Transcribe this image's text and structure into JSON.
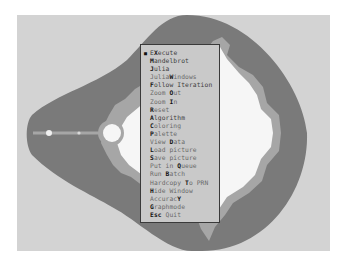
{
  "app": {
    "name": "Mandelbrot fractal explorer",
    "colors": {
      "background": "#d3d3d3",
      "outer_band": "#7a7a7a",
      "fringe": "#a8a8a8",
      "set_interior": "#f7f7f7",
      "menu_bg": "#c9c9c9",
      "menu_border": "#3a3a3a",
      "hotkey": "#111111",
      "menu_text": "#6a6a6a"
    }
  },
  "menu": {
    "items": [
      {
        "pre": "E",
        "key": "X",
        "post": "ecute",
        "selected": true,
        "bullet": "■"
      },
      {
        "pre": "",
        "key": "M",
        "post": "andelbrot"
      },
      {
        "pre": "",
        "key": "J",
        "post": "ulia"
      },
      {
        "pre": "Julia",
        "key": "W",
        "post": "indows"
      },
      {
        "pre": "",
        "key": "F",
        "post": "ollow Iteration"
      },
      {
        "pre": "Zoom ",
        "key": "O",
        "post": "ut"
      },
      {
        "pre": "Zoom ",
        "key": "I",
        "post": "n"
      },
      {
        "pre": "",
        "key": "R",
        "post": "eset"
      },
      {
        "pre": "",
        "key": "A",
        "post": "lgorithm"
      },
      {
        "pre": "",
        "key": "C",
        "post": "oloring"
      },
      {
        "pre": "",
        "key": "P",
        "post": "alette"
      },
      {
        "pre": "View ",
        "key": "D",
        "post": "ata"
      },
      {
        "pre": "",
        "key": "L",
        "post": "oad picture"
      },
      {
        "pre": "",
        "key": "S",
        "post": "ave picture"
      },
      {
        "pre": "Put in ",
        "key": "Q",
        "post": "ueue"
      },
      {
        "pre": "Run ",
        "key": "B",
        "post": "atch"
      },
      {
        "pre": "Hardcopy ",
        "key": "T",
        "post": "o PRN"
      },
      {
        "pre": "",
        "key": "H",
        "post": "ide Window"
      },
      {
        "pre": "Accurac",
        "key": "Y",
        "post": ""
      },
      {
        "pre": "",
        "key": "G",
        "post": "raphmode"
      },
      {
        "pre": "",
        "key": "Esc",
        "post": " Quit"
      }
    ]
  }
}
